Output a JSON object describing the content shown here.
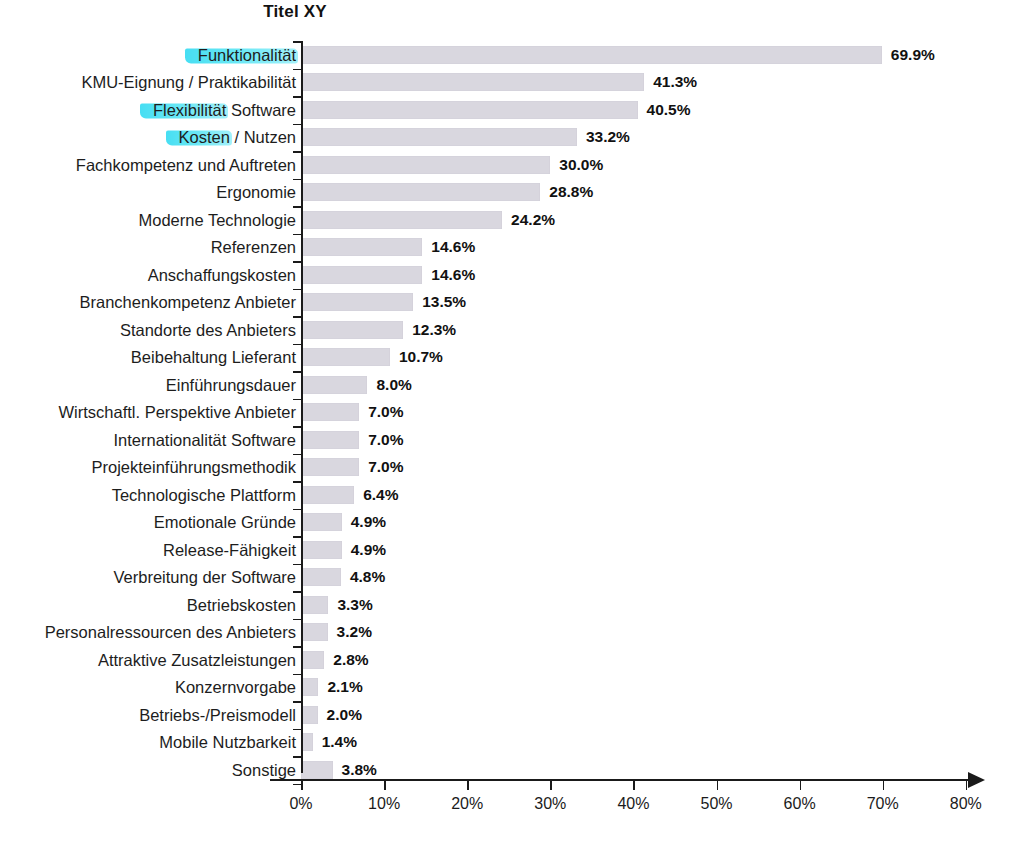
{
  "chart_data": {
    "type": "bar",
    "orientation": "horizontal",
    "title": "Titel XY",
    "xlabel": "",
    "ylabel": "",
    "xlim": [
      0,
      80
    ],
    "grid": false,
    "legend": false,
    "value_suffix": "%",
    "bar_color": "#d9d7df",
    "highlight_color": "#4de0f0",
    "axis_color": "#1a1a1a",
    "categories": [
      "Funktionalität",
      "KMU-Eignung / Praktikabilität",
      "Flexibilität Software",
      "Kosten / Nutzen",
      "Fachkompetenz und Auftreten",
      "Ergonomie",
      "Moderne Technologie",
      "Referenzen",
      "Anschaffungskosten",
      "Branchenkompetenz Anbieter",
      "Standorte des Anbieters",
      "Beibehaltung Lieferant",
      "Einführungsdauer",
      "Wirtschaftl. Perspektive Anbieter",
      "Internationalität Software",
      "Projekteinführungsmethodik",
      "Technologische Plattform",
      "Emotionale Gründe",
      "Release-Fähigkeit",
      "Verbreitung der Software",
      "Betriebskosten",
      "Personalressourcen des Anbieters",
      "Attraktive Zusatzleistungen",
      "Konzernvorgabe",
      "Betriebs-/Preismodell",
      "Mobile Nutzbarkeit",
      "Sonstige"
    ],
    "values": [
      69.9,
      41.3,
      40.5,
      33.2,
      30.0,
      28.8,
      24.2,
      14.6,
      14.6,
      13.5,
      12.3,
      10.7,
      8.0,
      7.0,
      7.0,
      7.0,
      6.4,
      4.9,
      4.9,
      4.8,
      3.3,
      3.2,
      2.8,
      2.1,
      2.0,
      1.4,
      3.8
    ],
    "value_labels": [
      "69.9%",
      "41.3%",
      "40.5%",
      "33.2%",
      "30.0%",
      "28.8%",
      "24.2%",
      "14.6%",
      "14.6%",
      "13.5%",
      "12.3%",
      "10.7%",
      "8.0%",
      "7.0%",
      "7.0%",
      "7.0%",
      "6.4%",
      "4.9%",
      "4.9%",
      "4.8%",
      "3.3%",
      "3.2%",
      "2.8%",
      "2.1%",
      "2.0%",
      "1.4%",
      "3.8%"
    ],
    "xticks": [
      0,
      10,
      20,
      30,
      40,
      50,
      60,
      70,
      80
    ],
    "xtick_labels": [
      "0%",
      "10%",
      "20%",
      "30%",
      "40%",
      "50%",
      "60%",
      "70%",
      "80%"
    ],
    "highlighted_categories": [
      {
        "index": 0,
        "marked_text": "Funktionalität"
      },
      {
        "index": 2,
        "marked_text": "Flexibilität"
      },
      {
        "index": 3,
        "marked_text": "Kosten"
      }
    ]
  }
}
